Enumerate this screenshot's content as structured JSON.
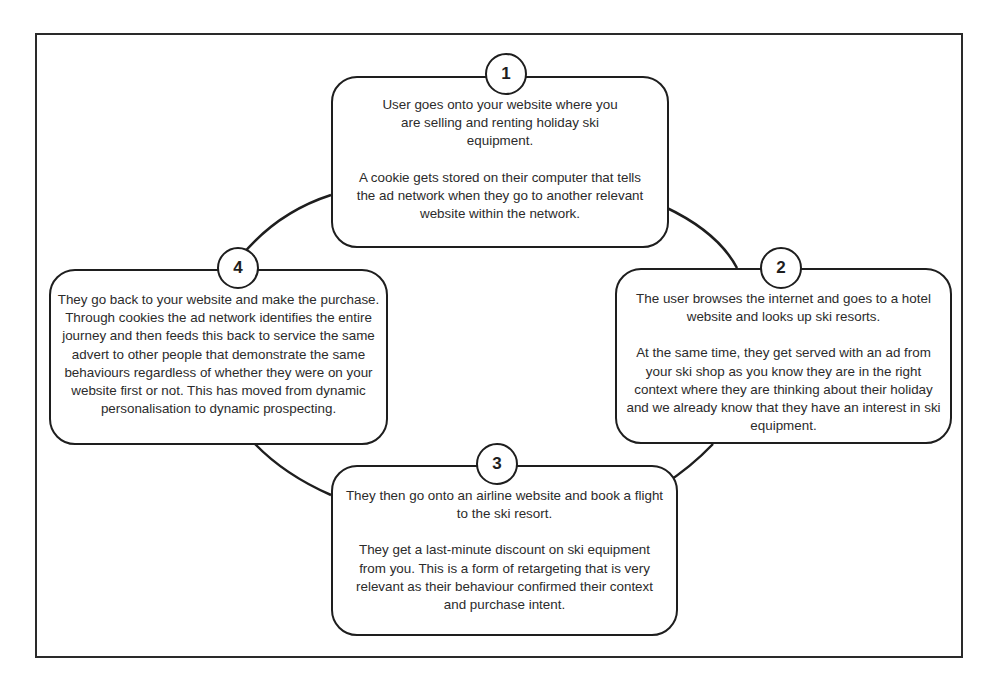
{
  "diagram": {
    "type": "cycle",
    "title": "",
    "steps": [
      {
        "number": "1",
        "paragraphs": [
          "User goes onto your website where you are selling and renting holiday ski equipment.",
          "A cookie gets stored on their computer that tells the ad network when they go to another relevant website within the network."
        ]
      },
      {
        "number": "2",
        "paragraphs": [
          "The user browses the internet and goes to a hotel website and looks up ski resorts.",
          "At the same time, they get served with an ad from your ski shop as you know they are in the right context where they are thinking about their holiday and we already know that they have an interest in ski equipment."
        ]
      },
      {
        "number": "3",
        "paragraphs": [
          "They then go onto an airline website and book a flight to the ski resort.",
          "They get a last-minute discount on ski equipment from you. This is a form of retargeting that is very relevant as their behaviour confirmed their context and purchase intent."
        ]
      },
      {
        "number": "4",
        "paragraphs": [
          "They go back to your website and make the purchase. Through cookies the ad network identifies the entire journey and then feeds this back to service the same advert to other people that demonstrate the same behaviours regardless of whether they were on your website first or not. This has moved from dynamic personalisation to dynamic prospecting."
        ]
      }
    ],
    "colors": {
      "stroke": "#1e1e1e",
      "text": "#2b2b2b",
      "background": "#ffffff"
    }
  }
}
